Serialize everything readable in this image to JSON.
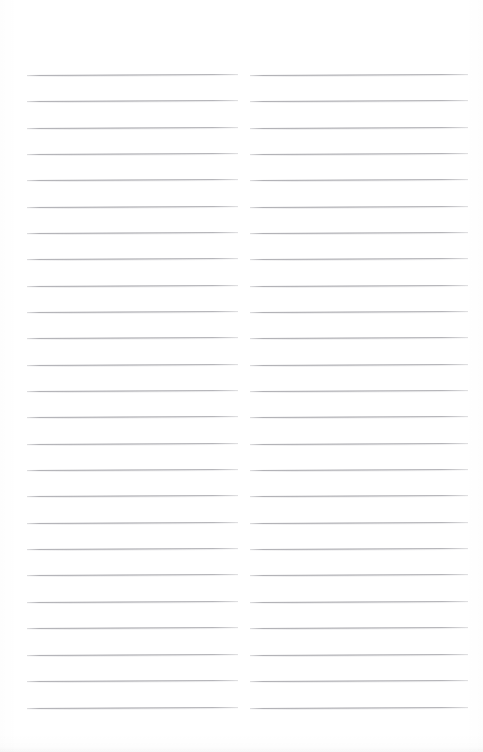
{
  "document": {
    "kind": "scanned-blank-ruled-page",
    "page_width": 483,
    "page_height": 752,
    "background_color": "#ffffff",
    "rule_color": "#96969c",
    "has_text": false,
    "has_header": false,
    "has_footer": false,
    "has_page_number": false
  },
  "layout": {
    "columns": 2,
    "column_gutter_px": 12,
    "first_line_y": 75,
    "line_spacing_px": 26.3,
    "lines_per_column": 25,
    "skew_degrees": -0.3
  },
  "columns": [
    {
      "name": "left-column",
      "left_px": 27,
      "width_px": 211,
      "lines": [
        {
          "y": 75,
          "text": ""
        },
        {
          "y": 101,
          "text": ""
        },
        {
          "y": 128,
          "text": ""
        },
        {
          "y": 154,
          "text": ""
        },
        {
          "y": 180,
          "text": ""
        },
        {
          "y": 207,
          "text": ""
        },
        {
          "y": 233,
          "text": ""
        },
        {
          "y": 259,
          "text": ""
        },
        {
          "y": 286,
          "text": ""
        },
        {
          "y": 312,
          "text": ""
        },
        {
          "y": 338,
          "text": ""
        },
        {
          "y": 365,
          "text": ""
        },
        {
          "y": 391,
          "text": ""
        },
        {
          "y": 417,
          "text": ""
        },
        {
          "y": 444,
          "text": ""
        },
        {
          "y": 470,
          "text": ""
        },
        {
          "y": 496,
          "text": ""
        },
        {
          "y": 523,
          "text": ""
        },
        {
          "y": 549,
          "text": ""
        },
        {
          "y": 575,
          "text": ""
        },
        {
          "y": 602,
          "text": ""
        },
        {
          "y": 628,
          "text": ""
        },
        {
          "y": 655,
          "text": ""
        },
        {
          "y": 681,
          "text": ""
        },
        {
          "y": 708,
          "text": ""
        }
      ]
    },
    {
      "name": "right-column",
      "left_px": 250,
      "width_px": 218,
      "lines": [
        {
          "y": 75,
          "text": ""
        },
        {
          "y": 101,
          "text": ""
        },
        {
          "y": 128,
          "text": ""
        },
        {
          "y": 154,
          "text": ""
        },
        {
          "y": 180,
          "text": ""
        },
        {
          "y": 207,
          "text": ""
        },
        {
          "y": 233,
          "text": ""
        },
        {
          "y": 259,
          "text": ""
        },
        {
          "y": 286,
          "text": ""
        },
        {
          "y": 312,
          "text": ""
        },
        {
          "y": 338,
          "text": ""
        },
        {
          "y": 365,
          "text": ""
        },
        {
          "y": 391,
          "text": ""
        },
        {
          "y": 417,
          "text": ""
        },
        {
          "y": 444,
          "text": ""
        },
        {
          "y": 470,
          "text": ""
        },
        {
          "y": 496,
          "text": ""
        },
        {
          "y": 523,
          "text": ""
        },
        {
          "y": 549,
          "text": ""
        },
        {
          "y": 575,
          "text": ""
        },
        {
          "y": 602,
          "text": ""
        },
        {
          "y": 628,
          "text": ""
        },
        {
          "y": 655,
          "text": ""
        },
        {
          "y": 681,
          "text": ""
        },
        {
          "y": 708,
          "text": ""
        }
      ]
    }
  ]
}
